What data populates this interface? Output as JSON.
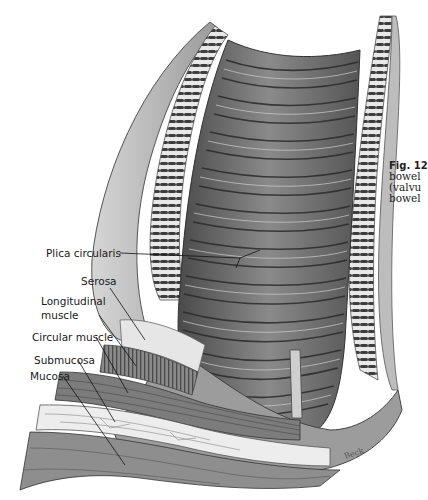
{
  "figure": {
    "labels": [
      {
        "id": "plica",
        "text": "Plica  circularis"
      },
      {
        "id": "serosa",
        "text": "Serosa"
      },
      {
        "id": "longitudinal_1",
        "text": "Longitudinal"
      },
      {
        "id": "longitudinal_2",
        "text": "muscle"
      },
      {
        "id": "circular",
        "text": "Circular muscle"
      },
      {
        "id": "submucosa",
        "text": "Submucosa"
      },
      {
        "id": "mucosa",
        "text": "Mucosa"
      }
    ],
    "artist_signature": "Beck",
    "caption_lines": [
      {
        "bold": "Fig. 12",
        "text": ""
      },
      {
        "bold": "",
        "text": "bowel"
      },
      {
        "bold": "",
        "text": "(valvu"
      },
      {
        "bold": "",
        "text": "bowel"
      }
    ]
  },
  "colors": {
    "background": "#ffffff",
    "fold_dark": "#3a3a3a",
    "fold_mid": "#7a7a7a",
    "fold_light": "#c8c8c8",
    "serosa": "#e4e4e4",
    "label_text": "#1a1a1a"
  }
}
